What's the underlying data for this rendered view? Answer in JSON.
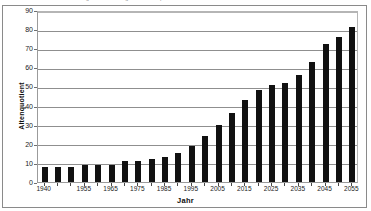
{
  "figure": {
    "clipped_caption": "Abbildung: Entwicklung des Altenquotienten in Deutschland",
    "x_axis_title": "Jahr",
    "y_axis_title": "Altenquotient"
  },
  "chart_data": {
    "type": "bar",
    "title": "",
    "xlabel": "Jahr",
    "ylabel": "Altenquotient",
    "ylim": [
      0,
      90
    ],
    "ytick_step": 10,
    "yticks": [
      0,
      10,
      20,
      30,
      40,
      50,
      60,
      70,
      80,
      90
    ],
    "grid": true,
    "legend": "none",
    "bar_color": "#111111",
    "categories": [
      "1940",
      "1945",
      "1950",
      "1955",
      "1960",
      "1965",
      "1970",
      "1975",
      "1980",
      "1985",
      "1990",
      "1995",
      "2000",
      "2005",
      "2010",
      "2015",
      "2020",
      "2025",
      "2030",
      "2035",
      "2040",
      "2045",
      "2050",
      "2055"
    ],
    "xtick_labels": [
      "1940",
      "1955",
      "1965",
      "1975",
      "1985",
      "1995",
      "2005",
      "2015",
      "2025",
      "2035",
      "2045",
      "2055"
    ],
    "values": [
      8,
      8,
      8,
      9,
      9,
      9,
      11,
      11,
      12,
      13,
      15,
      19,
      24,
      30,
      36,
      43,
      48,
      51,
      52,
      56,
      63,
      72,
      76,
      81
    ]
  }
}
